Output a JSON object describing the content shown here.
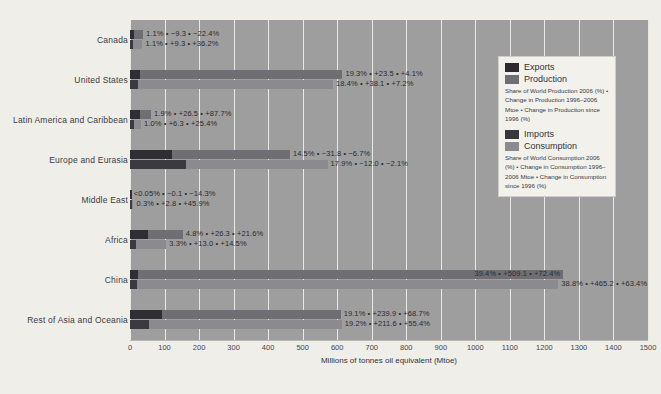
{
  "chart_data": {
    "type": "bar",
    "title": "",
    "xlabel": "Millions of tonnes oil equivalent (Mtoe)",
    "ylabel": "",
    "xlim": [
      0,
      1500
    ],
    "xticks": [
      "0",
      "100",
      "200",
      "300",
      "400",
      "500",
      "600",
      "700",
      "800",
      "900",
      "1000",
      "1100",
      "1200",
      "1300",
      "1400",
      "1500"
    ],
    "grid": true,
    "legend_position": "right",
    "categories": [
      "Canada",
      "United States",
      "Latin America and Caribbean",
      "Europe and Eurasia",
      "Middle East",
      "Africa",
      "China",
      "Rest of Asia and Oceania"
    ],
    "series": [
      {
        "name": "Production",
        "values": [
          38,
          615,
          61,
          463,
          2,
          153,
          1255,
          610
        ]
      },
      {
        "name": "Exports",
        "values": [
          13,
          28,
          28,
          122,
          2,
          52,
          24,
          92
        ]
      },
      {
        "name": "Consumption",
        "values": [
          36,
          588,
          32,
          572,
          10,
          105,
          1240,
          613
        ]
      },
      {
        "name": "Imports",
        "values": [
          10,
          24,
          11,
          162,
          2,
          18,
          20,
          56
        ]
      }
    ],
    "rows": [
      {
        "category": "Canada",
        "production_bar": 38,
        "exports_bar": 13,
        "consumption_bar": 36,
        "imports_bar": 10,
        "production_label": "1.1% • −9.3 • −22.4%",
        "consumption_label": "1.1% • +9.3 • +36.2%",
        "production_share_pct": 1.1,
        "production_change_mtoe": -9.3,
        "production_change_pct": -22.4,
        "consumption_share_pct": 1.1,
        "consumption_change_mtoe": 9.3,
        "consumption_change_pct": 36.2
      },
      {
        "category": "United States",
        "production_bar": 615,
        "exports_bar": 28,
        "consumption_bar": 588,
        "imports_bar": 24,
        "production_label": "19.3% • +23.5 • +4.1%",
        "consumption_label": "18.4% • +38.1 • +7.2%",
        "production_share_pct": 19.3,
        "production_change_mtoe": 23.5,
        "production_change_pct": 4.1,
        "consumption_share_pct": 18.4,
        "consumption_change_mtoe": 38.1,
        "consumption_change_pct": 7.2
      },
      {
        "category": "Latin America and Caribbean",
        "production_bar": 61,
        "exports_bar": 28,
        "consumption_bar": 32,
        "imports_bar": 11,
        "production_label": "1.9% • +26.5 • +87.7%",
        "consumption_label": "1.0% • +6.3 • +25.4%",
        "production_share_pct": 1.9,
        "production_change_mtoe": 26.5,
        "production_change_pct": 87.7,
        "consumption_share_pct": 1.0,
        "consumption_change_mtoe": 6.3,
        "consumption_change_pct": 25.4
      },
      {
        "category": "Europe and Eurasia",
        "production_bar": 463,
        "exports_bar": 122,
        "consumption_bar": 572,
        "imports_bar": 162,
        "production_label": "14.5% • −31.8 • −6.7%",
        "consumption_label": "17.9% • −12.0 • −2.1%",
        "production_share_pct": 14.5,
        "production_change_mtoe": -31.8,
        "production_change_pct": -6.7,
        "consumption_share_pct": 17.9,
        "consumption_change_mtoe": -12.0,
        "consumption_change_pct": -2.1
      },
      {
        "category": "Middle East",
        "production_bar": 2,
        "exports_bar": 2,
        "consumption_bar": 10,
        "imports_bar": 2,
        "production_label": "<0.05% • −0.1 • −14.3%",
        "consumption_label": "0.3% • +2.8 • +45.9%",
        "production_share_pct": 0.05,
        "production_change_mtoe": -0.1,
        "production_change_pct": -14.3,
        "consumption_share_pct": 0.3,
        "consumption_change_mtoe": 2.8,
        "consumption_change_pct": 45.9
      },
      {
        "category": "Africa",
        "production_bar": 153,
        "exports_bar": 52,
        "consumption_bar": 105,
        "imports_bar": 18,
        "production_label": "4.8% • +26.3 • +21.6%",
        "consumption_label": "3.3% • +13.0 • +14.5%",
        "production_share_pct": 4.8,
        "production_change_mtoe": 26.3,
        "production_change_pct": 21.6,
        "consumption_share_pct": 3.3,
        "consumption_change_mtoe": 13.0,
        "consumption_change_pct": 14.5
      },
      {
        "category": "China",
        "production_bar": 1255,
        "exports_bar": 24,
        "consumption_bar": 1240,
        "imports_bar": 20,
        "production_label": "39.4% • +509.1 • +72.4%",
        "consumption_label": "38.8% • +465.2 • +63.4%",
        "production_share_pct": 39.4,
        "production_change_mtoe": 509.1,
        "production_change_pct": 72.4,
        "consumption_share_pct": 38.8,
        "consumption_change_mtoe": 465.2,
        "consumption_change_pct": 63.4
      },
      {
        "category": "Rest of Asia and Oceania",
        "production_bar": 610,
        "exports_bar": 92,
        "consumption_bar": 613,
        "imports_bar": 56,
        "production_label": "19.1% • +239.9 • +68.7%",
        "consumption_label": "19.2% • +211.6 • +55.4%",
        "production_share_pct": 19.1,
        "production_change_mtoe": 239.9,
        "production_change_pct": 68.7,
        "consumption_share_pct": 19.2,
        "consumption_change_mtoe": 211.6,
        "consumption_change_pct": 55.4
      }
    ]
  },
  "legend": {
    "exports_label": "Exports",
    "production_label": "Production",
    "production_note": "Share of World Production 2006 (%) • Change in Production 1996–2006 Mtoe • Change in Production since 1996 (%)",
    "imports_label": "Imports",
    "consumption_label": "Consumption",
    "consumption_note": "Share of World Consumption 2006 (%) • Change in Consumption 1996–2006 Mtoe • Change in Consumption since 1996 (%)"
  },
  "colors": {
    "plot_background": "#9e9e9e",
    "page_background": "#efeee9",
    "production": "#6f6f73",
    "consumption": "#8b8b8f",
    "exports": "#2e2e33",
    "imports": "#3a3a40",
    "gridline": "#e8e8e4"
  },
  "caption": ""
}
